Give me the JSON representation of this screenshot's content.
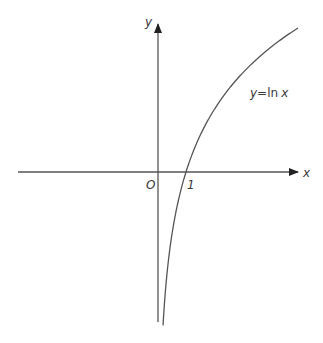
{
  "figure": {
    "x_axis_label": "x",
    "y_axis_label": "y",
    "origin_label": "O",
    "tick_label_one": "1",
    "curve_label_y": "y",
    "curve_label_eq": "=",
    "curve_label_ln": "ln",
    "curve_label_x": "x"
  },
  "colors": {
    "axis": "#555555",
    "curve": "#555555",
    "text": "#3a3a3a",
    "background": "#ffffff"
  },
  "geometry": {
    "origin_px": [
      158,
      172
    ],
    "x_unit_px": 28,
    "y_unit_px": 89.5,
    "x_range": [
      0.18,
      5.0
    ]
  }
}
